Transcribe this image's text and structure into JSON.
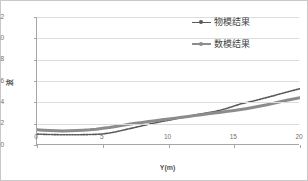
{
  "chart_data": {
    "type": "line",
    "title": "",
    "subtitle": "",
    "xlabel": "Y(m)",
    "ylabel": "波",
    "xlim": [
      0,
      20
    ],
    "ylim": [
      0,
      12
    ],
    "xticks": [
      "0",
      "5",
      "10",
      "15",
      "20"
    ],
    "yticks": [
      "0",
      "2",
      "4",
      "6",
      "8",
      "10",
      "12"
    ],
    "grid": "horizontal",
    "legend_position": "inside-upper-right",
    "x": [
      0,
      0.5,
      1,
      1.5,
      2,
      2.5,
      3,
      3.5,
      4,
      4.5,
      5,
      5.5,
      6,
      6.5,
      7,
      7.5,
      8,
      8.5,
      9,
      9.5,
      10,
      10.5,
      11,
      11.5,
      12,
      12.5,
      13,
      13.5,
      14,
      14.5,
      15,
      15.5,
      16,
      16.5,
      17,
      17.5,
      18,
      18.5,
      19,
      19.5,
      20
    ],
    "series": [
      {
        "name": "物模结果",
        "style": "thin-dotted",
        "color": "#595959",
        "values": [
          1.02,
          1.0,
          0.98,
          0.97,
          0.96,
          0.96,
          0.96,
          0.97,
          0.98,
          1.0,
          1.04,
          1.12,
          1.24,
          1.38,
          1.52,
          1.66,
          1.8,
          1.94,
          2.08,
          2.2,
          2.32,
          2.44,
          2.56,
          2.68,
          2.8,
          2.92,
          3.02,
          3.14,
          3.28,
          3.46,
          3.66,
          3.86,
          4.0,
          4.14,
          4.3,
          4.46,
          4.62,
          4.8,
          4.96,
          5.12,
          5.28
        ]
      },
      {
        "name": "数模结果",
        "style": "thick-solid",
        "color": "#8c8c8c",
        "values": [
          1.42,
          1.38,
          1.35,
          1.33,
          1.32,
          1.33,
          1.35,
          1.38,
          1.42,
          1.48,
          1.56,
          1.64,
          1.74,
          1.84,
          1.94,
          2.04,
          2.12,
          2.2,
          2.28,
          2.36,
          2.44,
          2.52,
          2.6,
          2.68,
          2.76,
          2.84,
          2.92,
          3.0,
          3.08,
          3.16,
          3.24,
          3.33,
          3.43,
          3.54,
          3.66,
          3.78,
          3.92,
          4.06,
          4.2,
          4.32,
          4.42
        ]
      }
    ]
  }
}
